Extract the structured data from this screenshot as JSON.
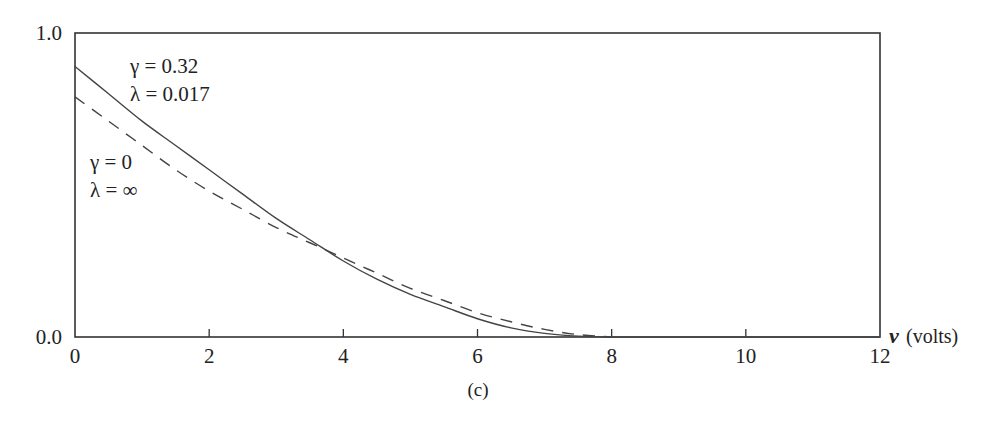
{
  "chart_data": {
    "type": "line",
    "title": "",
    "caption": "(c)",
    "xlabel_var": "v",
    "xlabel_unit": "(volts)",
    "ylabel": "",
    "xlim": [
      0,
      12
    ],
    "ylim": [
      0.0,
      1.0
    ],
    "grid": false,
    "x_ticks": [
      0,
      2,
      4,
      6,
      8,
      10,
      12
    ],
    "x_tick_labels": [
      "0",
      "2",
      "4",
      "6",
      "8",
      "10",
      "12"
    ],
    "y_ticks": [
      0.0,
      1.0
    ],
    "y_tick_labels": [
      "0.0",
      "1.0"
    ],
    "series": [
      {
        "name": "γ = 0.32, λ = 0.017",
        "style": "solid",
        "annotation": [
          "γ = 0.32",
          "λ = 0.017"
        ],
        "x": [
          0,
          0.5,
          1,
          1.5,
          2,
          2.5,
          3,
          3.5,
          4,
          4.5,
          5,
          5.5,
          6,
          6.5,
          7,
          7.5,
          8,
          8.5,
          9,
          10,
          12
        ],
        "y": [
          0.89,
          0.8,
          0.71,
          0.63,
          0.55,
          0.47,
          0.39,
          0.32,
          0.25,
          0.19,
          0.14,
          0.1,
          0.06,
          0.03,
          0.012,
          0.003,
          0.0,
          0.0,
          0.0,
          0.0,
          0.0
        ]
      },
      {
        "name": "γ = 0, λ = ∞",
        "style": "dashed",
        "annotation": [
          "γ = 0",
          "λ = ∞"
        ],
        "x": [
          0,
          0.5,
          1,
          1.5,
          2,
          2.5,
          3,
          3.5,
          4,
          4.5,
          5,
          5.5,
          6,
          6.5,
          7,
          7.5,
          8
        ],
        "y": [
          0.79,
          0.71,
          0.63,
          0.55,
          0.48,
          0.42,
          0.36,
          0.31,
          0.26,
          0.21,
          0.16,
          0.12,
          0.08,
          0.05,
          0.025,
          0.008,
          0.0
        ]
      }
    ]
  },
  "labels": {
    "y_top": "1.0",
    "y_bottom": "0.0",
    "x_var": "v",
    "x_unit": "(volts)",
    "caption": "(c)",
    "solid_line1": "γ = 0.32",
    "solid_line2": "λ = 0.017",
    "dashed_line1": "γ = 0",
    "dashed_line2": "λ = ∞"
  },
  "colors": {
    "axis": "#333333",
    "curve": "#444444",
    "text": "#222222"
  }
}
